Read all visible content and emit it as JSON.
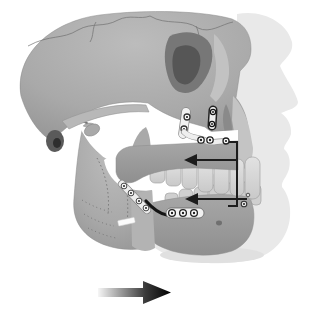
{
  "figure": {
    "kind": "medical-illustration",
    "background": "#ffffff"
  },
  "colors": {
    "silhouette": "#e9e9e9",
    "silhouette_shadow": "#e0e0e0",
    "bone_light": "#bcbcbc",
    "bone_mid": "#a9a9a9",
    "bone_dark": "#929292",
    "segment_light": "#a7a7a7",
    "segment_dark": "#8f8f8f",
    "strip": "#b3b3b3",
    "arch": "#b8b8b8",
    "orbit_outer": "#777777",
    "orbit_inner": "#565656",
    "ear_outer": "#5a5a5a",
    "ear_inner": "#2e2e2e",
    "aperture": "#8a8a8a",
    "premaxilla": "#c4c4c4",
    "tooth_light": "#e2e2e2",
    "tooth_dark": "#c9c9c9",
    "tooth_lower": "#cfcfcf",
    "bone_outline": "#8b8b8b",
    "suture": "#6f6f6f",
    "dotted": "#7a7a7a",
    "plate_fill": "#f1f1f1",
    "plate_outline": "#888888",
    "plate_outline_dark": "#222222",
    "screw_fill": "#ffffff",
    "screw_dot": "#222222",
    "osteotomy_line": "#141414",
    "annotation": "#1c1c1c",
    "foramen": "#707070",
    "gap_white": "#ffffff",
    "motion_start": "#f6f6f6",
    "motion_mid1": "#9e9e9e",
    "motion_mid2": "#3a3a3a",
    "motion_end": "#000000"
  },
  "annotations": {
    "maxilla_setback_arrow": {
      "direction": "left"
    },
    "mandible_setback_arrow": {
      "direction": "left"
    },
    "connector_bracket": {
      "shape": "vertical-L"
    },
    "motion_arrow": {
      "direction": "right",
      "style": "light-to-dark gradient"
    }
  },
  "hardware": {
    "maxillary_miniplates": 2,
    "maxillary_screw_row": 3,
    "mandible_diagonal_screws": 4,
    "mandible_horizontal_plate_screws": 3,
    "chin_screws": 2
  }
}
